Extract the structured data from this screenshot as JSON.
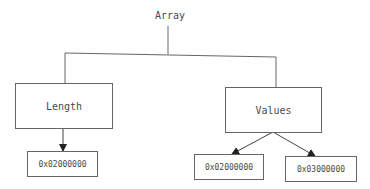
{
  "diagram": {
    "root": {
      "label": "Array"
    },
    "children": [
      {
        "label": "Length",
        "items": [
          {
            "label": "0x02000000"
          }
        ]
      },
      {
        "label": "Values",
        "items": [
          {
            "label": "0x02000000"
          },
          {
            "label": "0x03000000"
          }
        ]
      }
    ]
  },
  "colors": {
    "line": "#666666",
    "text": "#4a4a4a",
    "background": "#ffffff"
  }
}
